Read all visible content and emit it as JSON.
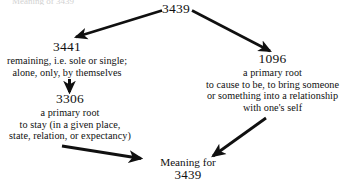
{
  "diagram": {
    "type": "flow-diagram",
    "title_fragment": "Meaning of 3439",
    "background_color": "#ffffff",
    "ink_color": "#101010",
    "nodes": [
      {
        "id": "root",
        "label": "3439",
        "gloss": []
      },
      {
        "id": "3441",
        "label": "3441",
        "gloss": [
          "remaining, i.e. sole or single;",
          "alone, only, by themselves"
        ]
      },
      {
        "id": "3306",
        "label": "3306",
        "gloss": [
          "a primary root",
          "to stay (in a given place,",
          "state, relation, or expectancy)"
        ]
      },
      {
        "id": "1096",
        "label": "1096",
        "gloss": [
          "a primary root",
          "to cause to be, to bring someone",
          "or something into a relationship",
          "with one's self"
        ]
      },
      {
        "id": "meaning",
        "label": "Meaning for",
        "number": "3439",
        "gloss": []
      }
    ],
    "arrows": [
      {
        "name": "arrow-root-to-3441",
        "from": "root",
        "to": "3441"
      },
      {
        "name": "arrow-root-to-1096",
        "from": "root",
        "to": "1096"
      },
      {
        "name": "arrow-3441-to-3306",
        "from": "3441",
        "to": "3306"
      },
      {
        "name": "arrow-3306-to-meaning",
        "from": "3306",
        "to": "meaning"
      },
      {
        "name": "arrow-1096-to-meaning",
        "from": "1096",
        "to": "meaning"
      }
    ]
  }
}
